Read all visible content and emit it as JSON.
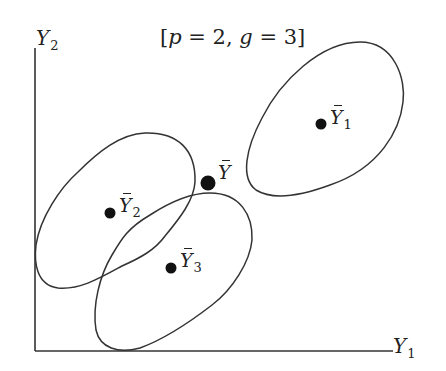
{
  "diagram": {
    "title": {
      "text": "[p = 2, g = 3]",
      "open": "[",
      "p_var": "p",
      "eq1": " = 2, ",
      "g_var": "g",
      "eq2": " = 3]"
    },
    "axes": {
      "x_label": {
        "main": "Y",
        "sub": "1"
      },
      "y_label": {
        "main": "Y",
        "sub": "2"
      },
      "origin": [
        35,
        351
      ],
      "x_end": [
        393,
        351
      ],
      "y_end": [
        35,
        48
      ],
      "stroke": "#333333"
    },
    "groups": [
      {
        "id": "group-1",
        "label": {
          "main": "Y",
          "sub": "1",
          "bar": true
        },
        "mean_point": [
          321,
          124
        ],
        "ellipse_path": "M 360 42 C 395 42 406 80 403 102 C 400 130 380 168 330 185 C 300 196 272 200 256 190 C 240 178 246 148 262 118 C 280 82 320 42 360 42 Z"
      },
      {
        "id": "group-2",
        "label": {
          "main": "Y",
          "sub": "2",
          "bar": true
        },
        "mean_point": [
          110,
          213
        ],
        "ellipse_path": "M 145 133 C 178 132 196 150 195 182 C 194 200 180 218 165 236 C 155 250 140 258 122 266 C 100 278 80 290 58 288 C 36 285 34 262 36 245 C 40 218 60 188 78 172 C 98 152 120 134 145 133 Z"
      },
      {
        "id": "group-3",
        "label": {
          "main": "Y",
          "sub": "3",
          "bar": true
        },
        "mean_point": [
          171,
          268
        ],
        "ellipse_path": "M 210 193 C 240 193 253 215 252 240 C 250 262 232 290 212 305 C 190 322 162 340 140 348 C 118 354 100 348 96 330 C 92 305 100 275 112 255 C 122 238 128 228 150 215 C 170 202 190 193 210 193 Z"
      }
    ],
    "grand_mean": {
      "label": {
        "main": "Y",
        "bar": true
      },
      "point": [
        208,
        183
      ]
    },
    "colors": {
      "line": "#333333",
      "dot": "#111111",
      "text": "#222222",
      "background": "#ffffff"
    }
  }
}
